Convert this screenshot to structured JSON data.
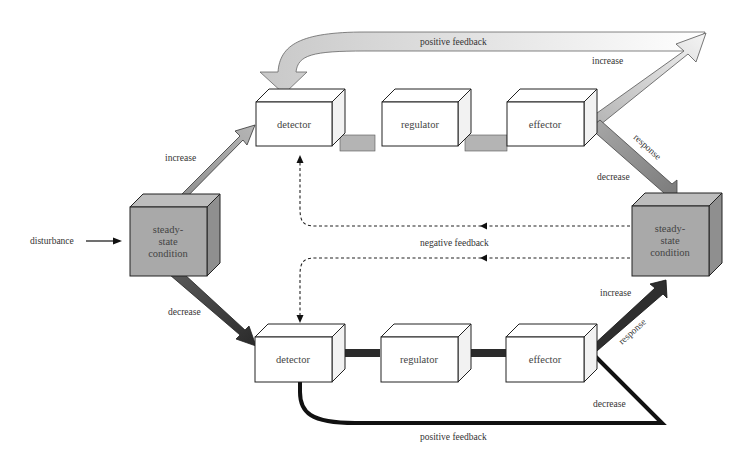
{
  "diagram": {
    "type": "homeostasis feedback loop",
    "inputs": {
      "disturbance": "disturbance"
    },
    "left_state": {
      "lines": [
        "steady-",
        "state",
        "condition"
      ]
    },
    "right_state": {
      "lines": [
        "steady-",
        "state",
        "condition"
      ]
    },
    "upper_chain": {
      "detector": "detector",
      "regulator": "regulator",
      "effector": "effector",
      "input_arrow_label": "increase",
      "output_up_label": "increase",
      "output_down_label": "decrease",
      "response_label": "response",
      "feedback_label": "positive feedback"
    },
    "lower_chain": {
      "detector": "detector",
      "regulator": "regulator",
      "effector": "effector",
      "input_arrow_label": "decrease",
      "output_up_label": "increase",
      "output_down_label": "decrease",
      "response_label": "response",
      "feedback_label": "positive feedback"
    },
    "negative_feedback_label": "negative feedback",
    "colors": {
      "upper_arrows": "#b8b8b8",
      "lower_arrows": "#2a2a2a",
      "state_box": "#a9a9a9",
      "box_fill": "#ffffff",
      "outline": "#222222"
    }
  }
}
